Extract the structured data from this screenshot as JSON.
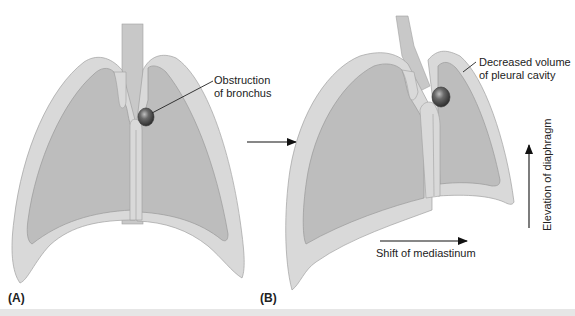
{
  "figure": {
    "panels": [
      {
        "id": "A",
        "label": "(A)",
        "annotations": [
          {
            "text_line1": "Obstruction",
            "text_line2": "of bronchus"
          }
        ]
      },
      {
        "id": "B",
        "label": "(B)",
        "annotations": [
          {
            "text_line1": "Decreased volume",
            "text_line2": "of pleural cavity"
          },
          {
            "text": "Shift of mediastinum"
          },
          {
            "text": "Elevation of diaphragm"
          }
        ]
      }
    ],
    "transition_arrow": "arrow-right",
    "colors": {
      "pleura": "#d9d9d9",
      "lung": "#bdbdbd",
      "outline": "#9a9a9a",
      "obstruction": "#555555",
      "text": "#222222",
      "arrow": "#111111",
      "background": "#ffffff"
    }
  }
}
